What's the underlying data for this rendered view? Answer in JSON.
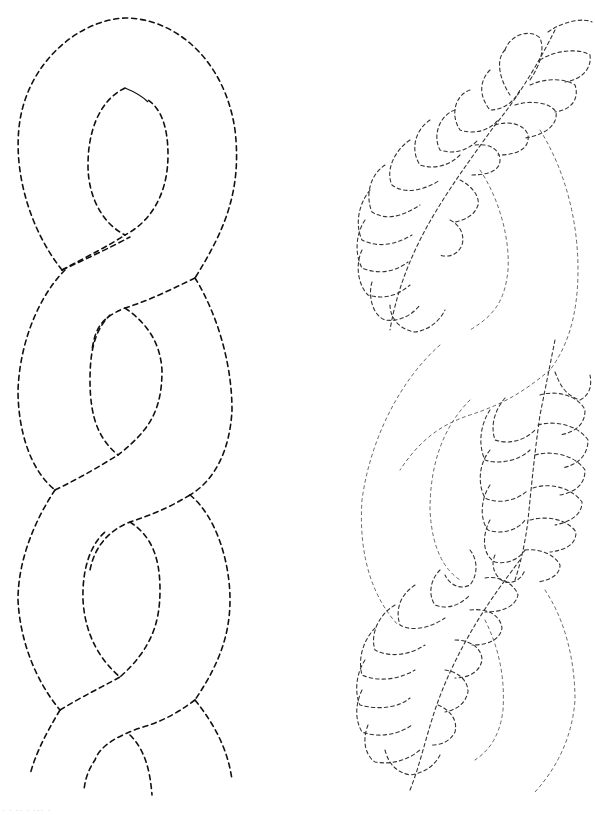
{
  "page": {
    "background": "#ffffff",
    "line_color": "#111111"
  },
  "patterns": [
    {
      "id": "cable-braid",
      "label": "Cable braid quilting stencil",
      "style": "bold dashed",
      "repeats": 4
    },
    {
      "id": "feathered-cable",
      "label": "Feathered cable quilting stencil",
      "style": "fine dashed",
      "feather_sections": 3
    }
  ],
  "caption": {
    "text": "· ·  ·· ·  ···  ·"
  }
}
